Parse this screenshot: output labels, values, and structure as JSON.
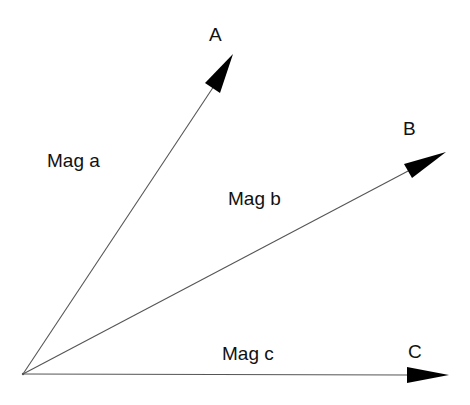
{
  "diagram": {
    "type": "vector-diagram",
    "origin": {
      "x": 23,
      "y": 374
    },
    "line_color": "#555555",
    "arrow_color": "#000000",
    "vectors": [
      {
        "id": "A",
        "endpoint_label": "A",
        "magnitude_label": "Mag a",
        "tip": {
          "x": 233,
          "y": 54
        }
      },
      {
        "id": "B",
        "endpoint_label": "B",
        "magnitude_label": "Mag b",
        "tip": {
          "x": 446,
          "y": 152
        }
      },
      {
        "id": "C",
        "endpoint_label": "C",
        "magnitude_label": "Mag c",
        "tip": {
          "x": 449,
          "y": 375
        }
      }
    ]
  }
}
